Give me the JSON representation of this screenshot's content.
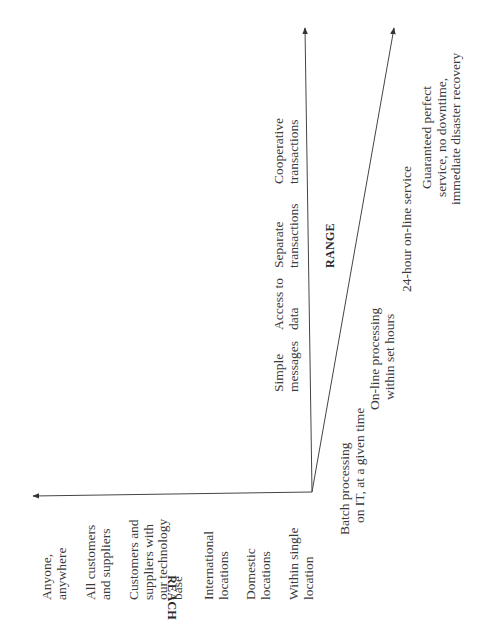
{
  "diagram": {
    "orientation": "rotated -90deg (text reads bottom-to-top)",
    "colors": {
      "line": "#444444",
      "text": "#3a3a3a",
      "background": "#ffffff"
    },
    "axes": {
      "reach": {
        "title": "REACH",
        "labels": [
          [
            "Within single",
            "location"
          ],
          [
            "Domestic",
            "locations"
          ],
          [
            "International",
            "locations"
          ],
          [
            "Customers and",
            "suppliers with",
            "our technology",
            "base"
          ],
          [
            "All customers",
            "and suppliers"
          ],
          [
            "Anyone,",
            "anywhere"
          ]
        ]
      },
      "range": {
        "title": "RANGE",
        "labels": [
          [
            "Simple",
            "messages"
          ],
          [
            "Access to",
            "data"
          ],
          [
            "Separate",
            "transactions"
          ],
          [
            "Cooperative",
            "transactions"
          ]
        ]
      },
      "responsiveness": {
        "title": "",
        "labels": [
          [
            "Batch processing",
            "on IT, at a given time"
          ],
          [
            "On-line processing",
            "within set hours"
          ],
          [
            "24-hour on-line service"
          ],
          [
            "Guaranteed perfect",
            "service, no downtime,",
            "immediate disaster recovery"
          ]
        ]
      }
    }
  }
}
